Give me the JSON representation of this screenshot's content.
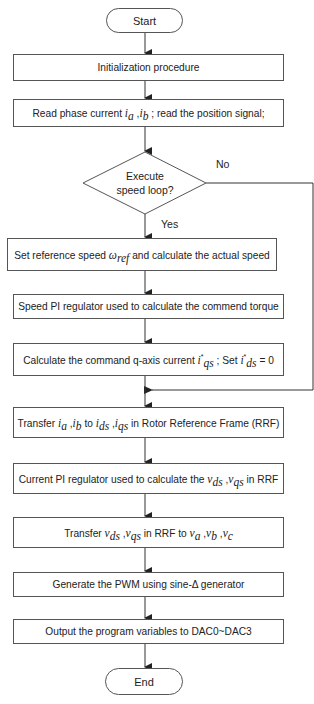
{
  "diagram": {
    "nodes": [
      {
        "id": "start",
        "type": "terminal",
        "label": "Start"
      },
      {
        "id": "init",
        "type": "process",
        "label": "Initialization procedure"
      },
      {
        "id": "read",
        "type": "process",
        "label": "Read phase current i_a, i_b ; read the position signal;",
        "parts": {
          "pre": "Read phase current ",
          "ia": "i",
          "ia_sub": "a",
          "comma": " ,",
          "ib": "i",
          "ib_sub": "b",
          "post": " ; read the position signal;"
        }
      },
      {
        "id": "decision",
        "type": "decision",
        "label": "Execute speed loop?",
        "line1": "Execute",
        "line2": "speed loop?"
      },
      {
        "id": "setref",
        "type": "process",
        "label": "Set reference speed ω_ref and calculate the actual speed",
        "parts": {
          "pre": "Set reference speed ",
          "w": "ω",
          "w_sub": "ref",
          "post": " and calculate the actual speed"
        }
      },
      {
        "id": "speedpi",
        "type": "process",
        "label": "Speed PI regulator used to calculate the commend torque"
      },
      {
        "id": "calcq",
        "type": "process",
        "label": "Calculate the command q-axis current i*_qs ; Set i*_ds = 0",
        "parts": {
          "pre": "Calculate the command q-axis current ",
          "iq": "i",
          "iq_sup": "*",
          "iq_sub": "qs",
          "mid": " ; Set ",
          "id": "i",
          "id_sup": "*",
          "id_sub": "ds",
          "post": " = 0"
        }
      },
      {
        "id": "transfer1",
        "type": "process",
        "label": "Transfer i_a, i_b to i_ds, i_qs in Rotor Reference Frame (RRF)",
        "parts": {
          "pre": "Transfer ",
          "ia": "i",
          "ia_sub": "a",
          "c1": " ,",
          "ib": "i",
          "ib_sub": "b",
          "to": " to ",
          "ids": "i",
          "ids_sub": "ds",
          "c2": " ,",
          "iqs": "i",
          "iqs_sub": "qs",
          "post": " in Rotor Reference Frame (RRF)"
        }
      },
      {
        "id": "currentpi",
        "type": "process",
        "label": "Current PI regulator used to calculate the v_ds, v_qs in RRF",
        "parts": {
          "pre": "Current PI regulator used to calculate the ",
          "vds": "v",
          "vds_sub": "ds",
          "c1": " ,",
          "vqs": "v",
          "vqs_sub": "qs",
          "post": " in RRF"
        }
      },
      {
        "id": "transfer2",
        "type": "process",
        "label": "Transfer v_ds, v_qs in RRF to v_a, v_b, v_c",
        "parts": {
          "pre": "Transfer ",
          "vds": "v",
          "vds_sub": "ds",
          "c1": " ,",
          "vqs": "v",
          "vqs_sub": "qs",
          "mid": " in RRF to ",
          "va": "v",
          "va_sub": "a",
          "c2": " ,",
          "vb": "v",
          "vb_sub": "b",
          "c3": " ,",
          "vc": "v",
          "vc_sub": "c"
        }
      },
      {
        "id": "pwm",
        "type": "process",
        "label": "Generate the PWM using sine-Δ generator"
      },
      {
        "id": "dac",
        "type": "process",
        "label": "Output the program variables to DAC0~DAC3"
      },
      {
        "id": "end",
        "type": "terminal",
        "label": "End"
      }
    ],
    "edges": [
      {
        "from": "start",
        "to": "init"
      },
      {
        "from": "init",
        "to": "read"
      },
      {
        "from": "read",
        "to": "decision"
      },
      {
        "from": "decision",
        "to": "setref",
        "label": "Yes"
      },
      {
        "from": "decision",
        "to": "transfer1",
        "label": "No"
      },
      {
        "from": "setref",
        "to": "speedpi"
      },
      {
        "from": "speedpi",
        "to": "calcq"
      },
      {
        "from": "calcq",
        "to": "transfer1"
      },
      {
        "from": "transfer1",
        "to": "currentpi"
      },
      {
        "from": "currentpi",
        "to": "transfer2"
      },
      {
        "from": "transfer2",
        "to": "pwm"
      },
      {
        "from": "pwm",
        "to": "dac"
      },
      {
        "from": "dac",
        "to": "end"
      }
    ],
    "branch_labels": {
      "yes": "Yes",
      "no": "No"
    },
    "colors": {
      "line": "#333333",
      "border": "#555555",
      "text": "#222222",
      "background": "#ffffff"
    }
  }
}
